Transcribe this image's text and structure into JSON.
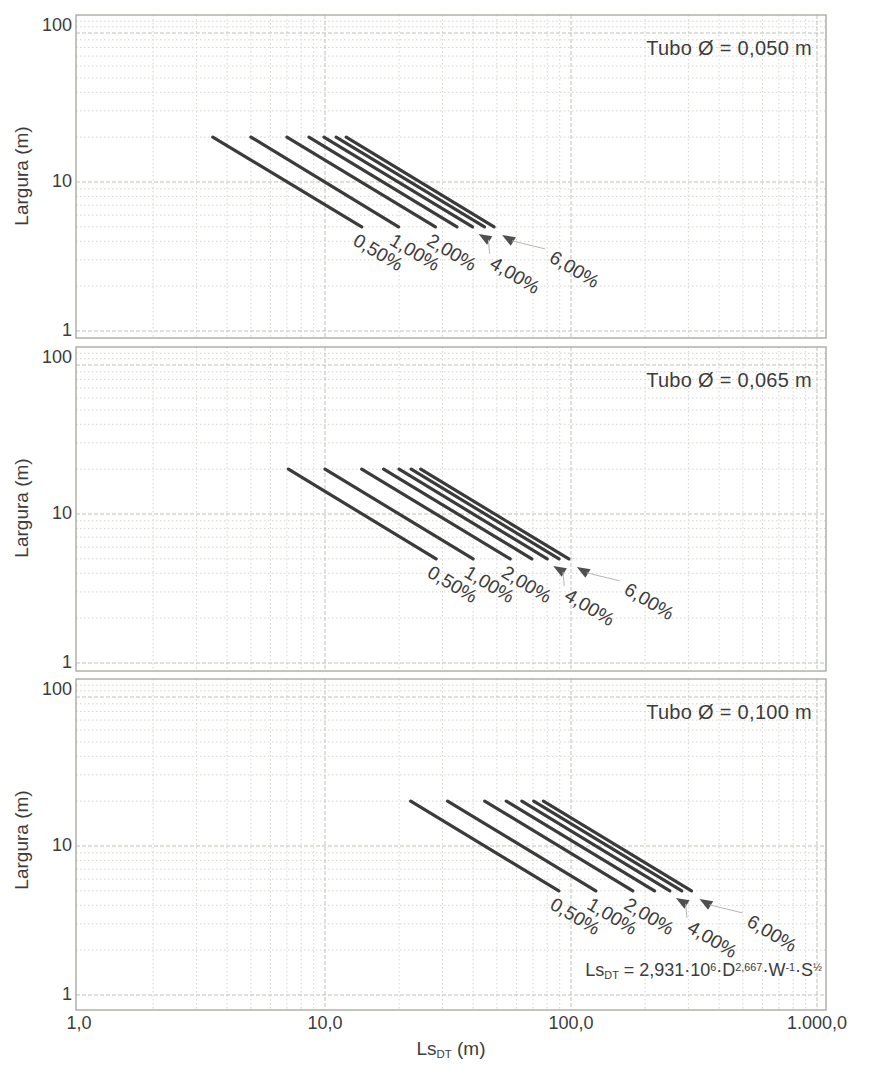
{
  "page": {
    "y_axis_title": "Largura (m)",
    "x_axis_title": {
      "base": "Ls",
      "sub": "DT",
      "unit": " (m)"
    },
    "x_ticks": [
      {
        "v": 1,
        "label": "1,0"
      },
      {
        "v": 10,
        "label": "10,0"
      },
      {
        "v": 100,
        "label": "100,0"
      },
      {
        "v": 1000,
        "label": "1.000,0"
      }
    ],
    "y_ticks": [
      {
        "v": 100,
        "label": "100"
      },
      {
        "v": 10,
        "label": "10"
      },
      {
        "v": 1,
        "label": "1"
      }
    ],
    "formula": {
      "lhs_base": "Ls",
      "lhs_sub": "DT",
      "eq": " = 2,931·10",
      "exp_10": "6",
      "term_d": "·D",
      "exp_d": "2,667",
      "term_w": "·W",
      "exp_w": "-1",
      "term_s": "·S",
      "exp_s": "½"
    },
    "colors": {
      "line": "#3b3b3b",
      "grid_minor": "#d3d6cd",
      "grid_major": "#bdc1b6",
      "frame": "#a9ada2",
      "text": "#3c3c3c",
      "arrow": "#4f4f4f",
      "leader": "#b5b8af",
      "background": "#ffffff"
    }
  },
  "chart_data": [
    {
      "type": "line",
      "title": "Tubo Ø = 0,050 m",
      "diameter_m": 0.05,
      "xlabel": "Ls_DT (m)",
      "ylabel": "Largura (m)",
      "xlim": [
        1,
        1000
      ],
      "ylim": [
        1,
        100
      ],
      "log_x": true,
      "log_y": true,
      "grid": true,
      "w_start": 20,
      "w_end": 5,
      "series": [
        {
          "name": "0,50%",
          "slope_pct": 0.5,
          "labeled": true,
          "arrow": false,
          "x_at_w20": 3.5,
          "x_at_w5": 14.1
        },
        {
          "name": "1,00%",
          "slope_pct": 1,
          "labeled": true,
          "arrow": false,
          "x_at_w20": 5.0,
          "x_at_w5": 19.9
        },
        {
          "name": "2,00%",
          "slope_pct": 2,
          "labeled": true,
          "arrow": false,
          "x_at_w20": 7.0,
          "x_at_w5": 28.1
        },
        {
          "name": "3,00%",
          "slope_pct": 3,
          "labeled": false,
          "arrow": false,
          "x_at_w20": 8.6,
          "x_at_w5": 34.4
        },
        {
          "name": "4,00%",
          "slope_pct": 4,
          "labeled": true,
          "arrow": true,
          "x_at_w20": 9.9,
          "x_at_w5": 39.8
        },
        {
          "name": "5,00%",
          "slope_pct": 5,
          "labeled": false,
          "arrow": false,
          "x_at_w20": 11.1,
          "x_at_w5": 44.5
        },
        {
          "name": "6,00%",
          "slope_pct": 6,
          "labeled": true,
          "arrow": true,
          "x_at_w20": 12.2,
          "x_at_w5": 48.7
        }
      ]
    },
    {
      "type": "line",
      "title": "Tubo Ø = 0,065 m",
      "diameter_m": 0.065,
      "xlabel": "Ls_DT (m)",
      "ylabel": "Largura (m)",
      "xlim": [
        1,
        1000
      ],
      "ylim": [
        1,
        100
      ],
      "log_x": true,
      "log_y": true,
      "grid": true,
      "w_start": 20,
      "w_end": 5,
      "series": [
        {
          "name": "0,50%",
          "slope_pct": 0.5,
          "labeled": true,
          "arrow": false,
          "x_at_w20": 7.1,
          "x_at_w5": 28.3
        },
        {
          "name": "1,00%",
          "slope_pct": 1,
          "labeled": true,
          "arrow": false,
          "x_at_w20": 10.0,
          "x_at_w5": 40.0
        },
        {
          "name": "2,00%",
          "slope_pct": 2,
          "labeled": true,
          "arrow": false,
          "x_at_w20": 14.1,
          "x_at_w5": 56.6
        },
        {
          "name": "3,00%",
          "slope_pct": 3,
          "labeled": false,
          "arrow": false,
          "x_at_w20": 17.3,
          "x_at_w5": 69.3
        },
        {
          "name": "4,00%",
          "slope_pct": 4,
          "labeled": true,
          "arrow": true,
          "x_at_w20": 20.0,
          "x_at_w5": 80.0
        },
        {
          "name": "5,00%",
          "slope_pct": 5,
          "labeled": false,
          "arrow": false,
          "x_at_w20": 22.4,
          "x_at_w5": 89.4
        },
        {
          "name": "6,00%",
          "slope_pct": 6,
          "labeled": true,
          "arrow": true,
          "x_at_w20": 24.5,
          "x_at_w5": 98.0
        }
      ]
    },
    {
      "type": "line",
      "title": "Tubo Ø = 0,100 m",
      "diameter_m": 0.1,
      "xlabel": "Ls_DT (m)",
      "ylabel": "Largura (m)",
      "xlim": [
        1,
        1000
      ],
      "ylim": [
        1,
        100
      ],
      "log_x": true,
      "log_y": true,
      "grid": true,
      "w_start": 20,
      "w_end": 5,
      "series": [
        {
          "name": "0,50%",
          "slope_pct": 0.5,
          "labeled": true,
          "arrow": false,
          "x_at_w20": 22.3,
          "x_at_w5": 89.2
        },
        {
          "name": "1,00%",
          "slope_pct": 1,
          "labeled": true,
          "arrow": false,
          "x_at_w20": 31.5,
          "x_at_w5": 126.1
        },
        {
          "name": "2,00%",
          "slope_pct": 2,
          "labeled": true,
          "arrow": false,
          "x_at_w20": 44.6,
          "x_at_w5": 178.4
        },
        {
          "name": "3,00%",
          "slope_pct": 3,
          "labeled": false,
          "arrow": false,
          "x_at_w20": 54.6,
          "x_at_w5": 218.5
        },
        {
          "name": "4,00%",
          "slope_pct": 4,
          "labeled": true,
          "arrow": true,
          "x_at_w20": 63.1,
          "x_at_w5": 252.3
        },
        {
          "name": "5,00%",
          "slope_pct": 5,
          "labeled": false,
          "arrow": false,
          "x_at_w20": 70.5,
          "x_at_w5": 282.1
        },
        {
          "name": "6,00%",
          "slope_pct": 6,
          "labeled": true,
          "arrow": true,
          "x_at_w20": 77.2,
          "x_at_w5": 309.0
        }
      ]
    }
  ]
}
